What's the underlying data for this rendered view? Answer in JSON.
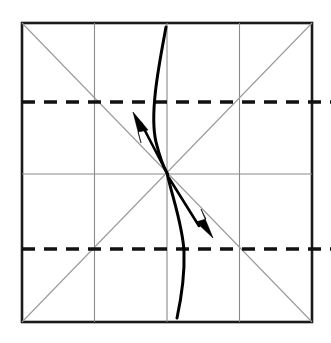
{
  "diagram": {
    "kind": "fold-instruction",
    "paper": {
      "name": "square-sheet",
      "left": 22,
      "top": 23,
      "right": 312,
      "bottom": 322,
      "width": 290,
      "height": 299,
      "border_color": "#1a1a1a",
      "fill_color": "#ffffff",
      "border_width": 2.6
    },
    "grid": {
      "color": "#8a8a8a",
      "width": 1.1,
      "vertical_x": [
        94.5,
        167,
        239.5
      ],
      "horizontal_y": [
        174
      ],
      "description": "quarter vertical creases and one horizontal mid crease"
    },
    "diagonals": {
      "color": "#9a9a9a",
      "width": 1.1,
      "lines": [
        {
          "name": "diagonal-tl-br",
          "x1": 22,
          "y1": 23,
          "x2": 312,
          "y2": 322
        },
        {
          "name": "diagonal-tr-bl",
          "x1": 312,
          "y1": 23,
          "x2": 22,
          "y2": 322
        }
      ]
    },
    "dashed_creases": {
      "color": "#111111",
      "width": 3.6,
      "dash_pattern": "13 9",
      "lines": [
        {
          "name": "upper-dashed-crease",
          "y": 102,
          "x1": 22,
          "x2": 331
        },
        {
          "name": "lower-dashed-crease",
          "y": 249,
          "x1": 22,
          "x2": 331
        }
      ]
    },
    "center_point": {
      "x": 167,
      "y": 174
    },
    "fold_curves": [
      {
        "name": "upper-fold-curve",
        "start": [
          166,
          27
        ],
        "control": [
          148,
          110
        ],
        "end": [
          167,
          173
        ],
        "stroke": "#000000",
        "width": 3.0
      },
      {
        "name": "lower-fold-curve",
        "start": [
          167,
          175
        ],
        "control": [
          185,
          258
        ],
        "end": [
          177,
          318
        ],
        "stroke": "#000000",
        "width": 3.0
      }
    ],
    "arrows": [
      {
        "name": "upper-fold-arrow",
        "direction": "up-left",
        "tail": [
          167,
          173
        ],
        "tip": [
          134,
          113
        ],
        "fill": "#000000"
      },
      {
        "name": "lower-fold-arrow",
        "direction": "down-right",
        "tail": [
          170,
          178
        ],
        "tip": [
          212,
          237
        ],
        "fill": "#000000"
      }
    ]
  }
}
